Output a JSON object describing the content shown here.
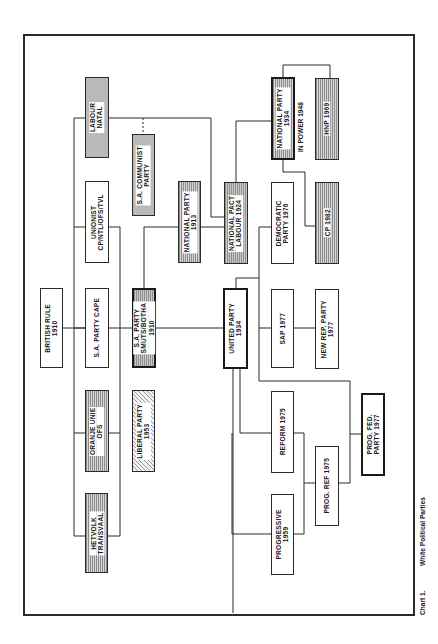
{
  "chart": {
    "caption_label": "Chart 1.",
    "caption_title": "White Political Parties"
  },
  "nodes": {
    "labour_natal": {
      "lines": [
        "LABOUR",
        "NATAL"
      ],
      "fill": "dots"
    },
    "sa_communist": {
      "lines": [
        "S.A. COMMUNIST",
        "PARTY"
      ],
      "fill": "dots"
    },
    "unionist": {
      "lines": [
        "UNIONIST",
        "CP/NTL/OFS/TVL"
      ],
      "fill": "none"
    },
    "national_party_1913": {
      "lines": [
        "NATIONAL PARTY",
        "1913"
      ],
      "fill": "vlines"
    },
    "national_pact": {
      "lines": [
        "NATIONAL PACT",
        "LABOUR   1924"
      ],
      "fill": "mixed"
    },
    "democratic_party": {
      "lines": [
        "DEMOCRATIC",
        "PARTY 1976"
      ],
      "fill": "none"
    },
    "cp_1982": {
      "lines": [
        "CP 1982"
      ],
      "fill": "vlines"
    },
    "national_party_1934": {
      "lines": [
        "NATIONAL PARTY",
        "1934"
      ],
      "fill": "vlines",
      "note": "IN POWER 1948"
    },
    "hnp_1969": {
      "lines": [
        "HNP 1969"
      ],
      "fill": "vlines"
    },
    "british_rule": {
      "lines": [
        "BRITISH RULE",
        "1910"
      ],
      "fill": "none"
    },
    "sa_party_cape": {
      "lines": [
        "S.A. PARTY CAPE"
      ],
      "fill": "none"
    },
    "sa_party_smuts": {
      "lines": [
        "S.A. PARTY",
        "SMUTS/BOTHA",
        "1910"
      ],
      "fill": "mixed"
    },
    "united_party": {
      "lines": [
        "UNITED PARTY",
        "1934"
      ],
      "fill": "none"
    },
    "sap_1977": {
      "lines": [
        "SAP 1977"
      ],
      "fill": "none"
    },
    "new_rep_party": {
      "lines": [
        "NEW REP. PARTY",
        "1977"
      ],
      "fill": "none"
    },
    "oranje_unie": {
      "lines": [
        "ORANJE UNIE",
        "OFS"
      ],
      "fill": "vlines"
    },
    "liberal_party": {
      "lines": [
        "LIBERAL PARTY",
        "1953"
      ],
      "fill": "hatch"
    },
    "hetvolk": {
      "lines": [
        "HETVOLK",
        "TRANSVAAL"
      ],
      "fill": "vlines"
    },
    "reform_1975": {
      "lines": [
        "REFORM 1975"
      ],
      "fill": "none"
    },
    "progressive_1959": {
      "lines": [
        "PROGRESSIVE",
        "1959"
      ],
      "fill": "none"
    },
    "prog_ref_1975": {
      "lines": [
        "PROG. REF 1975"
      ],
      "fill": "none"
    },
    "prog_fed_party": {
      "lines": [
        "PROG. FED.",
        "PARTY 1977"
      ],
      "fill": "none"
    }
  },
  "legend_colors": {
    "line": "#2a2a2a",
    "dots_fill": "#b9b9b9",
    "vlines_fill": "#d6d6d6",
    "hatch_fill": "#f2f2f2"
  }
}
